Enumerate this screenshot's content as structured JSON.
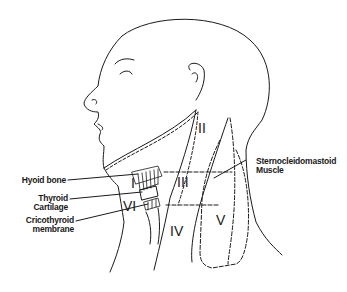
{
  "diagram": {
    "line_color": "#1a1a1a",
    "zones": [
      {
        "id": "I",
        "label": "I",
        "x": 134,
        "y": 176
      },
      {
        "id": "II",
        "label": "II",
        "x": 198,
        "y": 121
      },
      {
        "id": "III",
        "label": "III",
        "x": 178,
        "y": 176
      },
      {
        "id": "IV",
        "label": "IV",
        "x": 170,
        "y": 225
      },
      {
        "id": "V",
        "label": "V",
        "x": 215,
        "y": 216
      },
      {
        "id": "VI",
        "label": "VI",
        "x": 127,
        "y": 201
      }
    ],
    "annotations": [
      {
        "id": "hyoid",
        "lines": [
          "Hyoid bone"
        ]
      },
      {
        "id": "thyroid",
        "lines": [
          "Thyroid",
          "Cartilage"
        ]
      },
      {
        "id": "cricothyroid",
        "lines": [
          "Cricothyroid",
          "membrane"
        ]
      },
      {
        "id": "scm",
        "lines": [
          "Sternocleidomastoid",
          "Muscle"
        ]
      }
    ]
  }
}
